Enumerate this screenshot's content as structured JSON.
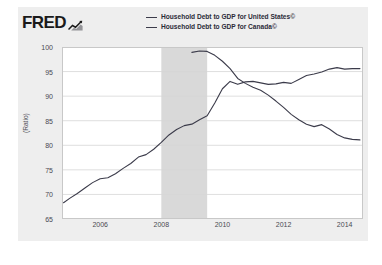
{
  "brand": {
    "name": "FRED",
    "mark_icon": "chart-squiggle-icon"
  },
  "legend": {
    "position": "top",
    "entries": [
      {
        "label": "Household Debt to GDP for United States©",
        "color": "#3b3b4a",
        "series": "united_states"
      },
      {
        "label": "Household Debt to GDP for Canada©",
        "color": "#3b3b4a",
        "series": "canada"
      }
    ]
  },
  "chart_data": {
    "type": "line",
    "title": "",
    "subtitle": "",
    "xlabel": "",
    "ylabel": "(Ratio)",
    "xlim": [
      2004.75,
      2014.6
    ],
    "ylim": [
      65,
      100
    ],
    "yticks": [
      65,
      70,
      75,
      80,
      85,
      90,
      95,
      100
    ],
    "xticks": [
      2006,
      2008,
      2010,
      2012,
      2014
    ],
    "grid": "horizontal",
    "legend_position": "top",
    "shaded_regions": [
      {
        "label": "recession",
        "x0": 2008.0,
        "x1": 2009.5,
        "color": "#d9d9d9"
      }
    ],
    "series": [
      {
        "name": "Household Debt to GDP for United States©",
        "color": "#3b3b4a",
        "points": [
          [
            2009.0,
            98.9
          ],
          [
            2009.25,
            99.2
          ],
          [
            2009.5,
            99.1
          ],
          [
            2009.75,
            98.3
          ],
          [
            2010.0,
            97.1
          ],
          [
            2010.25,
            95.6
          ],
          [
            2010.5,
            93.6
          ],
          [
            2010.75,
            92.6
          ],
          [
            2011.0,
            91.8
          ],
          [
            2011.25,
            91.2
          ],
          [
            2011.5,
            90.2
          ],
          [
            2011.75,
            89.0
          ],
          [
            2012.0,
            87.7
          ],
          [
            2012.25,
            86.3
          ],
          [
            2012.5,
            85.2
          ],
          [
            2012.75,
            84.3
          ],
          [
            2013.0,
            83.8
          ],
          [
            2013.25,
            84.2
          ],
          [
            2013.5,
            83.3
          ],
          [
            2013.75,
            82.2
          ],
          [
            2014.0,
            81.5
          ],
          [
            2014.25,
            81.2
          ],
          [
            2014.5,
            81.1
          ]
        ]
      },
      {
        "name": "Household Debt to GDP for Canada©",
        "color": "#3b3b4a",
        "points": [
          [
            2004.8,
            68.3
          ],
          [
            2005.0,
            69.2
          ],
          [
            2005.25,
            70.2
          ],
          [
            2005.5,
            71.3
          ],
          [
            2005.75,
            72.4
          ],
          [
            2006.0,
            73.2
          ],
          [
            2006.25,
            73.4
          ],
          [
            2006.5,
            74.2
          ],
          [
            2006.75,
            75.3
          ],
          [
            2007.0,
            76.3
          ],
          [
            2007.25,
            77.6
          ],
          [
            2007.5,
            78.1
          ],
          [
            2007.75,
            79.2
          ],
          [
            2008.0,
            80.6
          ],
          [
            2008.25,
            82.1
          ],
          [
            2008.5,
            83.2
          ],
          [
            2008.75,
            84.0
          ],
          [
            2009.0,
            84.3
          ],
          [
            2009.25,
            85.2
          ],
          [
            2009.5,
            86.0
          ],
          [
            2009.75,
            88.6
          ],
          [
            2010.0,
            91.5
          ],
          [
            2010.25,
            93.0
          ],
          [
            2010.5,
            92.4
          ],
          [
            2010.75,
            92.9
          ],
          [
            2011.0,
            93.0
          ],
          [
            2011.25,
            92.7
          ],
          [
            2011.5,
            92.4
          ],
          [
            2011.75,
            92.5
          ],
          [
            2012.0,
            92.8
          ],
          [
            2012.25,
            92.6
          ],
          [
            2012.5,
            93.4
          ],
          [
            2012.75,
            94.2
          ],
          [
            2013.0,
            94.5
          ],
          [
            2013.25,
            94.9
          ],
          [
            2013.5,
            95.5
          ],
          [
            2013.75,
            95.8
          ],
          [
            2014.0,
            95.5
          ],
          [
            2014.25,
            95.6
          ],
          [
            2014.5,
            95.6
          ]
        ]
      }
    ]
  }
}
